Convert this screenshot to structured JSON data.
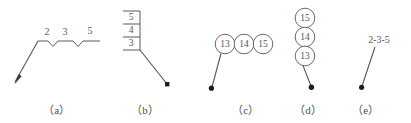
{
  "figure": {
    "background_color": "#ffffff",
    "line_color": "#5a5a5a",
    "text_color": "#555555",
    "dot_color": "#1d1d1d"
  },
  "captions": {
    "a": "（a）",
    "b": "（b）",
    "c": "（c）",
    "d": "（d）",
    "e": "（e）"
  },
  "variant_a": {
    "name": "horizontal-shelf-with-notches",
    "labels": [
      "2",
      "3",
      "5"
    ],
    "terminator": "filled-arrowhead"
  },
  "variant_b": {
    "name": "stacked-cell-table",
    "labels": [
      "5",
      "4",
      "3"
    ],
    "terminator": "filled-dot"
  },
  "variant_c": {
    "name": "horizontal-circle-row",
    "labels": [
      "13",
      "14",
      "15"
    ],
    "terminator": "filled-dot"
  },
  "variant_d": {
    "name": "vertical-circle-stack",
    "labels": [
      "15",
      "14",
      "13"
    ],
    "terminator": "filled-dot"
  },
  "variant_e": {
    "name": "inline-hyphenated-text",
    "labels": [
      "2-3-5"
    ],
    "terminator": "filled-dot"
  }
}
